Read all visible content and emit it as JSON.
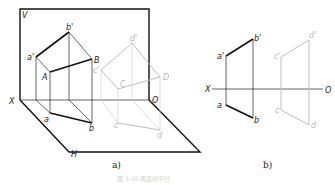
{
  "figure_a": {
    "caption": "a)",
    "planes": {
      "vertical": "V",
      "horizontal": "H"
    },
    "axis": {
      "start": "X",
      "end": "O"
    },
    "line_AB": {
      "space_points": [
        "A",
        "B"
      ],
      "front_projection": [
        "a'",
        "b'"
      ],
      "top_projection": [
        "a",
        "b"
      ]
    },
    "line_CD": {
      "space_points": [
        "C",
        "D"
      ],
      "front_projection": [
        "c'",
        "d'"
      ],
      "top_projection": [
        "c",
        "d"
      ]
    }
  },
  "figure_b": {
    "caption": "b)",
    "axis": {
      "start": "X",
      "end": "O"
    },
    "line_ab": {
      "front_projection": [
        "a'",
        "b'"
      ],
      "top_projection": [
        "a",
        "b"
      ]
    },
    "line_cd": {
      "front_projection": [
        "c'",
        "d'"
      ],
      "top_projection": [
        "c",
        "d"
      ]
    }
  },
  "figure_caption": "图 3-10 两直线平行"
}
